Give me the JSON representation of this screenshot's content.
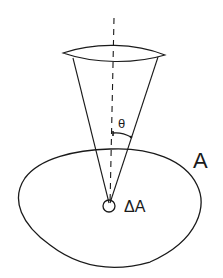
{
  "diagram": {
    "type": "solid-angle-cone-over-surface",
    "labels": {
      "surface": "A",
      "element": "ΔA",
      "angle": "θ"
    },
    "elements": [
      {
        "name": "surface-ellipse",
        "description": "Large closed curve representing surface A"
      },
      {
        "name": "area-element",
        "description": "Small circle representing area element ΔA"
      },
      {
        "name": "cone",
        "description": "Cone with apex at ΔA opening upward, elliptical top rim"
      },
      {
        "name": "axis",
        "description": "Vertical dashed line (normal) through ΔA"
      },
      {
        "name": "angle-arc",
        "description": "Arc marking half-angle θ between axis and cone edge"
      }
    ],
    "colors": {
      "stroke": "#1a1a1a",
      "background": "#ffffff"
    }
  }
}
